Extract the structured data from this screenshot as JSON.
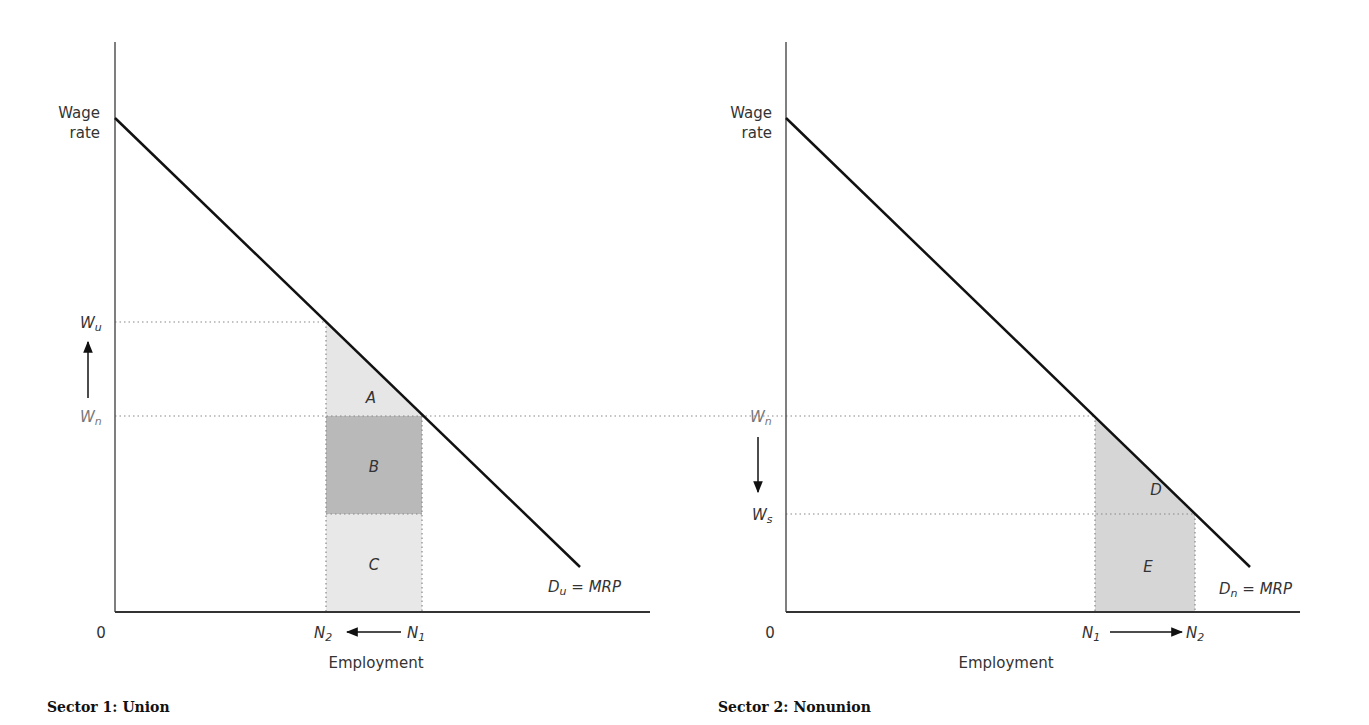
{
  "figure": {
    "panels": [
      {
        "caption": "Sector 1: Union",
        "y_axis_label_line1": "Wage",
        "y_axis_label_line2": "rate",
        "x_axis_label": "Employment",
        "origin": "0",
        "wage_labels": {
          "upper": "W",
          "upper_sub": "u",
          "lower": "W",
          "lower_sub": "n"
        },
        "emp_labels": {
          "left": "N",
          "left_sub": "2",
          "right": "N",
          "right_sub": "1"
        },
        "demand_label": {
          "main": "D",
          "sub": "u",
          "rest": " = MRP"
        },
        "areas": [
          "A",
          "B",
          "C"
        ]
      },
      {
        "caption": "Sector 2: Nonunion",
        "y_axis_label_line1": "Wage",
        "y_axis_label_line2": "rate",
        "x_axis_label": "Employment",
        "origin": "0",
        "wage_labels": {
          "upper": "W",
          "upper_sub": "n",
          "lower": "W",
          "lower_sub": "s"
        },
        "emp_labels": {
          "left": "N",
          "left_sub": "1",
          "right": "N",
          "right_sub": "2"
        },
        "demand_label": {
          "main": "D",
          "sub": "n",
          "rest": " = MRP"
        },
        "areas": [
          "D",
          "E"
        ]
      }
    ],
    "colors": {
      "light_shade": "#e6e6e6",
      "dark_shade": "#b9b9b9",
      "line": "#111111",
      "dotted": "#888888"
    }
  }
}
